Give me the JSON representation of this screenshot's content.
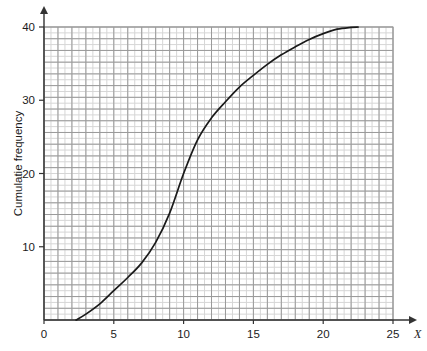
{
  "chart_data": {
    "type": "line",
    "title": "",
    "subtitle": "",
    "xlabel": "X",
    "ylabel": "Cumulatie frequency",
    "xlim": [
      0,
      25
    ],
    "ylim": [
      0,
      40
    ],
    "grid": true,
    "legend": false,
    "legend_position": "none",
    "x_ticks": [
      0,
      5,
      10,
      15,
      20,
      25
    ],
    "x_tick_labels": [
      "0",
      "5",
      "10",
      "15",
      "20",
      "25"
    ],
    "y_ticks": [
      10,
      20,
      30,
      40
    ],
    "y_tick_labels": [
      "10",
      "20",
      "30",
      "40"
    ],
    "minor_grid_step_x": 0.5,
    "minor_grid_step_y": 0.8,
    "major_grid_step_x": 1.0,
    "major_grid_step_y": 1.6,
    "series": [
      {
        "name": "Cumulative frequency ogive",
        "color": "#1a1a1a",
        "x": [
          2.3,
          3.0,
          4.0,
          5.0,
          6.0,
          7.0,
          8.0,
          9.0,
          10.0,
          11.0,
          12.0,
          13.0,
          14.0,
          15.0,
          16.0,
          17.0,
          18.0,
          19.0,
          20.0,
          21.0,
          22.0,
          22.5
        ],
        "y": [
          0.0,
          0.8,
          2.2,
          4.0,
          5.8,
          7.8,
          10.6,
          14.6,
          20.0,
          24.6,
          27.6,
          29.8,
          31.8,
          33.4,
          34.9,
          36.2,
          37.3,
          38.3,
          39.1,
          39.7,
          39.95,
          40.0
        ]
      }
    ]
  },
  "axis": {
    "y_label_text": "Cumulatie frequency",
    "x_variable_text": "X",
    "x_labels": [
      "0",
      "5",
      "10",
      "15",
      "20",
      "25"
    ],
    "y_labels": [
      "40",
      "30",
      "20",
      "10"
    ]
  },
  "colors": {
    "curve": "#1a1a1a",
    "axis": "#333333",
    "grid_minor": "#d6d6d6",
    "grid_major": "#9a9a9a",
    "background": "#ffffff"
  }
}
